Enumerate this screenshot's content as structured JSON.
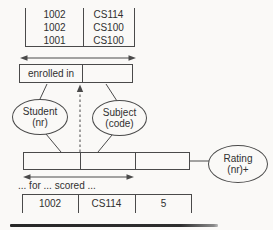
{
  "colors": {
    "stroke": "#4a4a4a",
    "text": "#303030",
    "background": "#faf9f7",
    "rule": "#2e2e2e"
  },
  "enrollment_table": {
    "rows": [
      [
        "1002",
        "CS114"
      ],
      [
        "1002",
        "CS100"
      ],
      [
        "1001",
        "CS100"
      ]
    ]
  },
  "predicate": {
    "label": "enrolled in"
  },
  "entities": {
    "student": {
      "name": "Student",
      "ref": "(nr)"
    },
    "subject": {
      "name": "Subject",
      "ref": "(code)"
    },
    "rating": {
      "name": "Rating",
      "ref": "(nr)+"
    }
  },
  "ternary": {
    "caption": "... for ... scored ...",
    "result_row": [
      "1002",
      "CS114",
      "5"
    ]
  }
}
